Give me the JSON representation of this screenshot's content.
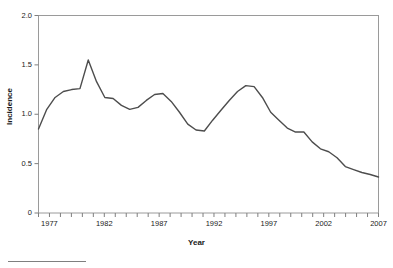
{
  "chart_data": {
    "type": "line",
    "title": "",
    "xlabel": "Year",
    "ylabel": "Incidence",
    "xlim": [
      1976,
      2007
    ],
    "ylim": [
      0,
      2.0
    ],
    "grid": false,
    "legend": null,
    "line_color": "#4d4d4d",
    "x": [
      1976,
      1977,
      1978,
      1979,
      1980,
      1981,
      1982,
      1983,
      1984,
      1985,
      1986,
      1987,
      1988,
      1989,
      1990,
      1991,
      1992,
      1993,
      1994,
      1995,
      1996,
      1997,
      1998,
      1999,
      2000,
      2001,
      2002,
      2003,
      2004,
      2005,
      2006,
      2007
    ],
    "values": [
      0.85,
      1.05,
      1.17,
      1.23,
      1.25,
      1.26,
      1.55,
      1.33,
      1.17,
      1.16,
      1.11,
      1.05,
      1.07,
      1.11,
      1.2,
      1.21,
      1.13,
      1.02,
      0.9,
      0.84,
      0.83,
      0.93,
      1.03,
      1.13,
      1.23,
      1.29,
      1.28,
      1.2,
      1.02,
      0.93,
      0.86,
      0.82
    ],
    "series": [
      {
        "name": "Incidence",
        "points": [
          {
            "x": 1976,
            "y": 0.85
          },
          {
            "x": 1977,
            "y": 1.05
          },
          {
            "x": 1978,
            "y": 1.17
          },
          {
            "x": 1979,
            "y": 1.23
          },
          {
            "x": 1980,
            "y": 1.25
          },
          {
            "x": 1981,
            "y": 1.26
          },
          {
            "x": 1981.8,
            "y": 1.55
          },
          {
            "x": 1983,
            "y": 1.33
          },
          {
            "x": 1984,
            "y": 1.17
          },
          {
            "x": 1985,
            "y": 1.16
          },
          {
            "x": 1986,
            "y": 1.09
          },
          {
            "x": 1987,
            "y": 1.05
          },
          {
            "x": 1988,
            "y": 1.07
          },
          {
            "x": 1989,
            "y": 1.14
          },
          {
            "x": 1990,
            "y": 1.2
          },
          {
            "x": 1991,
            "y": 1.21
          },
          {
            "x": 1992,
            "y": 1.13
          },
          {
            "x": 1993,
            "y": 1.02
          },
          {
            "x": 1994,
            "y": 0.9
          },
          {
            "x": 1995,
            "y": 0.84
          },
          {
            "x": 1996,
            "y": 0.83
          },
          {
            "x": 1997,
            "y": 0.94
          },
          {
            "x": 1998,
            "y": 1.04
          },
          {
            "x": 1999,
            "y": 1.14
          },
          {
            "x": 2000,
            "y": 1.23
          },
          {
            "x": 2001,
            "y": 1.29
          },
          {
            "x": 2002,
            "y": 1.28
          },
          {
            "x": 2003,
            "y": 1.17
          },
          {
            "x": 2004,
            "y": 1.02
          },
          {
            "x": 2005,
            "y": 0.94
          },
          {
            "x": 2006,
            "y": 0.86
          },
          {
            "x": 2007,
            "y": 0.82
          },
          {
            "x": 2008,
            "y": 0.82
          },
          {
            "x": 2009,
            "y": 0.72
          },
          {
            "x": 2010,
            "y": 0.65
          },
          {
            "x": 2011,
            "y": 0.62
          },
          {
            "x": 2012,
            "y": 0.56
          },
          {
            "x": 2013,
            "y": 0.47
          },
          {
            "x": 2014,
            "y": 0.44
          },
          {
            "x": 2015,
            "y": 0.41
          },
          {
            "x": 2016,
            "y": 0.39
          },
          {
            "x": 2017,
            "y": 0.365
          }
        ]
      }
    ],
    "yticks": [
      {
        "value": 2.0,
        "label": "2.0"
      },
      {
        "value": 1.5,
        "label": "1.5"
      },
      {
        "value": 1.0,
        "label": "1.0"
      },
      {
        "value": 0.5,
        "label": "0.5"
      },
      {
        "value": 0.0,
        "label": "0"
      }
    ],
    "xticks_major": [
      {
        "value": 1977,
        "label": "1977"
      },
      {
        "value": 1982,
        "label": "1982"
      },
      {
        "value": 1987,
        "label": "1987"
      },
      {
        "value": 1992,
        "label": "1992"
      },
      {
        "value": 1997,
        "label": "1997"
      },
      {
        "value": 2002,
        "label": "2002"
      },
      {
        "value": 2007,
        "label": "2007"
      }
    ],
    "xticks_minor": [
      1976,
      1978,
      1979,
      1980,
      1981,
      1983,
      1984,
      1985,
      1986,
      1988,
      1989,
      1990,
      1991,
      1993,
      1994,
      1995,
      1996,
      1998,
      1999,
      2000,
      2001,
      2003,
      2004,
      2005,
      2006
    ]
  }
}
